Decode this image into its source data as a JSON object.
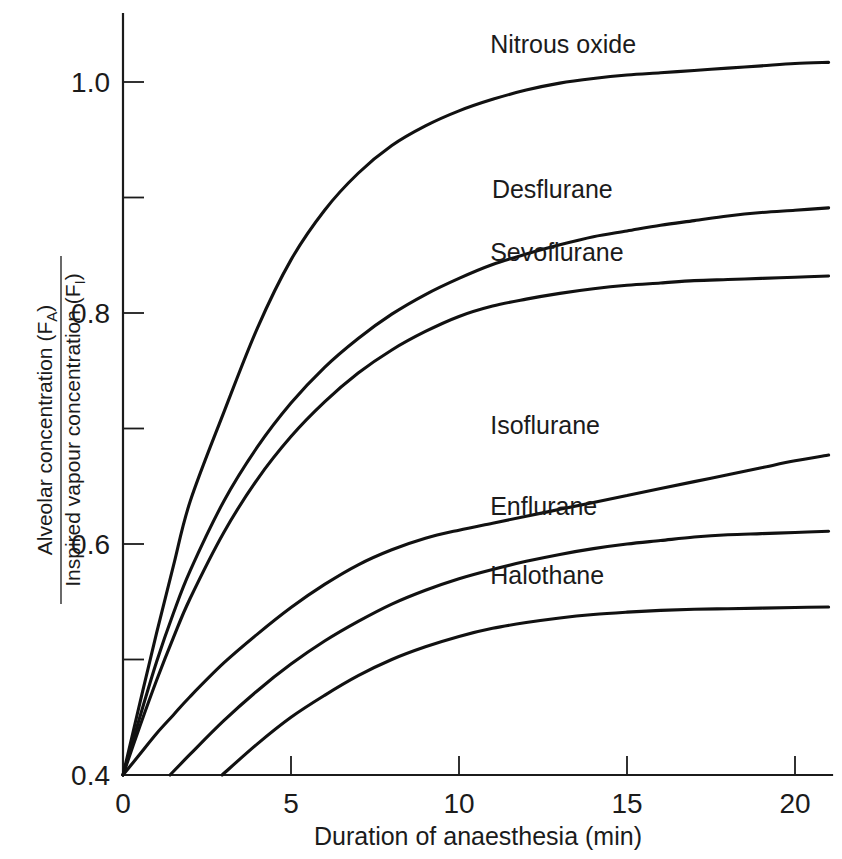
{
  "chart_data": {
    "type": "line",
    "title": "",
    "xlabel": "Duration of anaesthesia (min)",
    "ylabel_numerator": "Alveolar concentration (F",
    "ylabel_numerator_sub": "A",
    "ylabel_numerator_end": ")",
    "ylabel_denominator": "Inspired vapour concentration (F",
    "ylabel_denominator_sub": "I",
    "ylabel_denominator_end": ")",
    "xlim": [
      0,
      21
    ],
    "ylim": [
      0.4,
      1.06
    ],
    "xticks": [
      0,
      5,
      10,
      15,
      20
    ],
    "xtick_labels": [
      "0",
      "5",
      "10",
      "15",
      "20"
    ],
    "yticks": [
      0.4,
      0.5,
      0.6,
      0.7,
      0.8,
      0.9,
      1.0
    ],
    "ytick_labels": [
      "0.4",
      "",
      "0.6",
      "",
      "0.8",
      "",
      "1.0"
    ],
    "grid": false,
    "legend_position": "inline-right",
    "line_color": "#111111",
    "series": [
      {
        "name": "Nitrous oxide",
        "label_x": 14.5,
        "label_y": 1.025,
        "x": [
          0,
          0.5,
          1,
          1.5,
          2,
          3,
          4,
          5,
          6,
          7,
          8,
          9,
          10,
          11,
          12,
          13,
          14,
          15,
          16,
          17,
          18,
          19,
          20,
          21
        ],
        "values": [
          0.4,
          0.462,
          0.523,
          0.581,
          0.637,
          0.714,
          0.787,
          0.846,
          0.889,
          0.921,
          0.945,
          0.962,
          0.975,
          0.985,
          0.993,
          0.999,
          1.003,
          1.006,
          1.008,
          1.01,
          1.012,
          1.014,
          1.016,
          1.017
        ]
      },
      {
        "name": "Desflurane",
        "label_x": 14.55,
        "label_y": 0.9,
        "x": [
          0,
          0.5,
          1,
          1.5,
          2,
          3,
          4,
          5,
          6,
          7,
          8,
          9,
          10,
          11,
          12,
          13,
          14,
          15,
          16,
          17,
          18,
          19,
          20,
          21
        ],
        "values": [
          0.4,
          0.45,
          0.498,
          0.54,
          0.577,
          0.637,
          0.684,
          0.722,
          0.753,
          0.778,
          0.799,
          0.816,
          0.83,
          0.842,
          0.851,
          0.859,
          0.866,
          0.871,
          0.876,
          0.88,
          0.884,
          0.887,
          0.889,
          0.891
        ]
      },
      {
        "name": "Sevoflurane",
        "label_x": 14.5,
        "label_y": 0.845,
        "x": [
          0,
          0.5,
          1,
          1.5,
          2,
          3,
          4,
          5,
          6,
          7,
          8,
          9,
          10,
          11,
          12,
          13,
          14,
          15,
          16,
          17,
          18,
          19,
          20,
          21
        ],
        "values": [
          0.4,
          0.442,
          0.482,
          0.519,
          0.553,
          0.61,
          0.656,
          0.693,
          0.723,
          0.748,
          0.768,
          0.784,
          0.797,
          0.806,
          0.812,
          0.817,
          0.821,
          0.824,
          0.826,
          0.828,
          0.829,
          0.83,
          0.831,
          0.832
        ]
      },
      {
        "name": "Isoflurane",
        "label_x": 14.5,
        "label_y": 0.695,
        "x": [
          0,
          0.5,
          1,
          1.5,
          2,
          3,
          4,
          5,
          6,
          7,
          8,
          9,
          10,
          11,
          12,
          13,
          14,
          15,
          16,
          17,
          18,
          19,
          20,
          21
        ],
        "values": [
          0.4,
          0.418,
          0.436,
          0.452,
          0.468,
          0.497,
          0.522,
          0.545,
          0.565,
          0.582,
          0.595,
          0.605,
          0.612,
          0.618,
          0.624,
          0.63,
          0.636,
          0.642,
          0.648,
          0.654,
          0.66,
          0.666,
          0.672,
          0.677
        ]
      },
      {
        "name": "Enflurane",
        "label_x": 14.5,
        "label_y": 0.625,
        "x": [
          1.4,
          2,
          3,
          4,
          5,
          6,
          7,
          8,
          9,
          10,
          11,
          12,
          13,
          14,
          15,
          16,
          17,
          18,
          19,
          20,
          21
        ],
        "values": [
          0.4,
          0.418,
          0.447,
          0.473,
          0.496,
          0.516,
          0.533,
          0.548,
          0.56,
          0.57,
          0.578,
          0.585,
          0.591,
          0.596,
          0.6,
          0.603,
          0.606,
          0.608,
          0.609,
          0.61,
          0.611
        ]
      },
      {
        "name": "Halothane",
        "label_x": 14.5,
        "label_y": 0.565,
        "x": [
          2.95,
          4,
          5,
          6,
          7,
          8,
          9,
          10,
          11,
          12,
          13,
          14,
          15,
          16,
          17,
          18,
          19,
          20,
          21
        ],
        "values": [
          0.4,
          0.427,
          0.45,
          0.469,
          0.486,
          0.5,
          0.511,
          0.52,
          0.527,
          0.532,
          0.536,
          0.539,
          0.541,
          0.5425,
          0.5435,
          0.544,
          0.5445,
          0.545,
          0.5455
        ]
      }
    ]
  }
}
